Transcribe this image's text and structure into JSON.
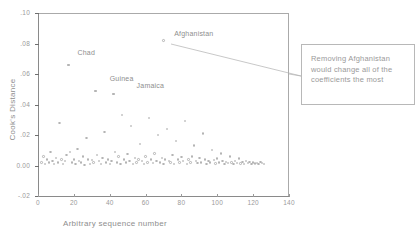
{
  "top_strip": {
    "text": " "
  },
  "chart_data": {
    "type": "scatter",
    "title": "",
    "xlabel": "Arbitrary sequence number",
    "ylabel": "Cook's Distance",
    "xlim": [
      0,
      140
    ],
    "ylim": [
      -0.02,
      0.1
    ],
    "xticks": [
      0,
      20,
      40,
      60,
      80,
      100,
      120,
      140
    ],
    "xtick_labels": [
      "0",
      "20",
      "40",
      "60",
      "80",
      "100",
      "120",
      "140"
    ],
    "yticks": [
      -0.02,
      0.0,
      0.02,
      0.04,
      0.06,
      0.08,
      0.1
    ],
    "ytick_labels": [
      "-.02",
      "0.00",
      ".02",
      ".04",
      ".06",
      ".08",
      ".10"
    ],
    "grid": false,
    "legend": "none",
    "series": [
      {
        "name": "Cook's Distance",
        "marker": "open-circle",
        "color": "#b4b4b4",
        "points": [
          [
            2,
            0.002
          ],
          [
            3,
            0.006
          ],
          [
            4,
            0.001
          ],
          [
            5,
            0.004
          ],
          [
            6,
            0.002
          ],
          [
            7,
            0.009
          ],
          [
            8,
            0.003
          ],
          [
            9,
            0.001
          ],
          [
            10,
            0.005
          ],
          [
            11,
            0.002
          ],
          [
            12,
            0.028
          ],
          [
            13,
            0.004
          ],
          [
            14,
            0.001
          ],
          [
            15,
            0.003
          ],
          [
            16,
            0.007
          ],
          [
            17,
            0.066
          ],
          [
            18,
            0.009
          ],
          [
            19,
            0.002
          ],
          [
            20,
            0.004
          ],
          [
            21,
            0.001
          ],
          [
            22,
            0.011
          ],
          [
            23,
            0.003
          ],
          [
            24,
            0.002
          ],
          [
            25,
            0.006
          ],
          [
            26,
            0.0005
          ],
          [
            27,
            0.018
          ],
          [
            28,
            0.004
          ],
          [
            29,
            0.001
          ],
          [
            30,
            0.0035
          ],
          [
            31,
            0.002
          ],
          [
            32,
            0.049
          ],
          [
            33,
            0.007
          ],
          [
            34,
            0.003
          ],
          [
            35,
            0.001
          ],
          [
            36,
            0.005
          ],
          [
            37,
            0.022
          ],
          [
            38,
            0.002
          ],
          [
            39,
            0.004
          ],
          [
            40,
            0.001
          ],
          [
            41,
            0.003
          ],
          [
            42,
            0.047
          ],
          [
            43,
            0.009
          ],
          [
            44,
            0.002
          ],
          [
            45,
            0.006
          ],
          [
            46,
            0.001
          ],
          [
            47,
            0.033
          ],
          [
            48,
            0.004
          ],
          [
            49,
            0.002
          ],
          [
            50,
            0.0075
          ],
          [
            51,
            0.003
          ],
          [
            52,
            0.026
          ],
          [
            53,
            0.001
          ],
          [
            54,
            0.005
          ],
          [
            55,
            0.002
          ],
          [
            56,
            0.004
          ],
          [
            57,
            0.014
          ],
          [
            58,
            0.003
          ],
          [
            59,
            0.001
          ],
          [
            60,
            0.006
          ],
          [
            61,
            0.002
          ],
          [
            62,
            0.031
          ],
          [
            63,
            0.004
          ],
          [
            64,
            0.0015
          ],
          [
            65,
            0.008
          ],
          [
            66,
            0.003
          ],
          [
            67,
            0.02
          ],
          [
            68,
            0.002
          ],
          [
            69,
            0.005
          ],
          [
            70,
            0.001
          ],
          [
            71,
            0.004
          ],
          [
            72,
            0.024
          ],
          [
            73,
            0.003
          ],
          [
            74,
            0.002
          ],
          [
            75,
            0.007
          ],
          [
            76,
            0.001
          ],
          [
            77,
            0.016
          ],
          [
            78,
            0.004
          ],
          [
            79,
            0.002
          ],
          [
            80,
            0.0055
          ],
          [
            81,
            0.003
          ],
          [
            82,
            0.029
          ],
          [
            83,
            0.001
          ],
          [
            84,
            0.004
          ],
          [
            85,
            0.002
          ],
          [
            86,
            0.006
          ],
          [
            87,
            0.013
          ],
          [
            88,
            0.003
          ],
          [
            89,
            0.0015
          ],
          [
            90,
            0.005
          ],
          [
            91,
            0.002
          ],
          [
            92,
            0.021
          ],
          [
            93,
            0.004
          ],
          [
            94,
            0.001
          ],
          [
            95,
            0.003
          ],
          [
            96,
            0.002
          ],
          [
            97,
            0.01
          ],
          [
            98,
            0.0035
          ],
          [
            99,
            0.0012
          ],
          [
            100,
            0.0045
          ],
          [
            101,
            0.002
          ],
          [
            102,
            0.008
          ],
          [
            103,
            0.003
          ],
          [
            104,
            0.001
          ],
          [
            105,
            0.0025
          ],
          [
            106,
            0.0015
          ],
          [
            107,
            0.006
          ],
          [
            108,
            0.002
          ],
          [
            109,
            0.001
          ],
          [
            110,
            0.003
          ],
          [
            111,
            0.0018
          ],
          [
            112,
            0.0045
          ],
          [
            113,
            0.0012
          ],
          [
            114,
            0.0022
          ],
          [
            115,
            0.001
          ],
          [
            116,
            0.003
          ],
          [
            117,
            0.0015
          ],
          [
            118,
            0.0025
          ],
          [
            119,
            0.001
          ],
          [
            120,
            0.002
          ],
          [
            121,
            0.0012
          ],
          [
            122,
            0.0018
          ],
          [
            123,
            0.001
          ],
          [
            124,
            0.0022
          ],
          [
            125,
            0.0015
          ],
          [
            126,
            0.001
          ]
        ]
      }
    ],
    "point_labels": [
      {
        "name": "Chad",
        "label_x": 22,
        "label_y": 0.074,
        "point_x": 17,
        "point_y": 0.066
      },
      {
        "name": "Guinea",
        "label_x": 40,
        "label_y": 0.057,
        "point_x": 32,
        "point_y": 0.049
      },
      {
        "name": "Jamaica",
        "label_x": 55,
        "label_y": 0.052,
        "point_x": 42,
        "point_y": 0.047
      },
      {
        "name": "Afghanistan",
        "label_x": 76,
        "label_y": 0.086,
        "point_x": 70,
        "point_y": 0.082
      }
    ]
  },
  "annotation": {
    "text": "Removing Afghanistan would change all of the coefficients the most"
  },
  "colors": {
    "axis": "#8a8a8a",
    "frame": "#aaaaaa",
    "marker": "#b4b4b4",
    "text": "#8e8e8e",
    "callout_border": "#b8b8b8"
  }
}
